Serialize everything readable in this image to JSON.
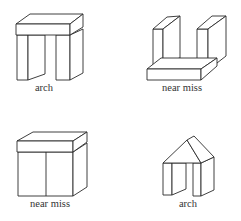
{
  "figure": {
    "examples": [
      {
        "id": "example-1",
        "label": "arch",
        "structure": "slab resting on two separated upright blocks"
      },
      {
        "id": "example-2",
        "label": "near miss",
        "structure": "two upright blocks standing apart with slab lying on the ground in front"
      },
      {
        "id": "example-3",
        "label": "near miss",
        "structure": "slab resting on two upright blocks that touch each other"
      },
      {
        "id": "example-4",
        "label": "arch",
        "structure": "wedge (triangular prism) resting on two separated upright blocks"
      }
    ],
    "colors": {
      "line": "#2a2a2a",
      "background": "#ffffff",
      "label": "#333333"
    }
  }
}
